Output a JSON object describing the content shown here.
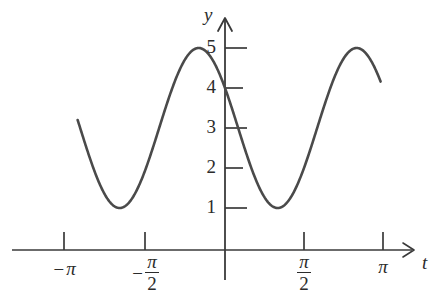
{
  "chart_data": {
    "type": "line",
    "title": "",
    "subtitle": "",
    "xlabel": "t",
    "ylabel": "y",
    "grid": false,
    "legend": "none",
    "xlim": [
      -3.6,
      3.55
    ],
    "ylim": [
      -0.75,
      5.9
    ],
    "xticks": [
      -3.14159,
      -1.5708,
      1.5708,
      3.14159
    ],
    "xticklabels": [
      "-π",
      "-π/2",
      "π/2",
      "π"
    ],
    "yticks": [
      1,
      2,
      3,
      4,
      5
    ],
    "yticklabels": [
      "1",
      "2",
      "3",
      "4",
      "5"
    ],
    "series": [
      {
        "name": "y(t)",
        "equation": "y = 3 + 2 sin(2t + 5π/6)",
        "amplitude": 2,
        "midline": 3,
        "period": 3.14159,
        "color": "#4a4a4a",
        "x": [
          -2.93,
          -2.8,
          -2.6,
          -2.4,
          -2.2,
          -2.0,
          -1.8,
          -1.6,
          -1.4,
          -1.2,
          -1.0,
          -0.8,
          -0.6,
          -0.4,
          -0.2,
          0.0,
          0.2,
          0.4,
          0.6,
          0.8,
          1.0,
          1.2,
          1.4,
          1.6,
          1.8,
          2.0,
          2.2,
          2.4,
          2.6,
          2.8,
          3.0,
          3.1
        ],
        "y": [
          3.0,
          3.5,
          4.27,
          4.82,
          4.99,
          4.73,
          4.1,
          3.26,
          2.37,
          1.6,
          1.12,
          1.01,
          1.29,
          1.9,
          2.72,
          3.0,
          3.99,
          4.62,
          4.97,
          4.91,
          4.43,
          3.66,
          2.75,
          1.9,
          1.3,
          1.02,
          1.16,
          1.67,
          2.47,
          3.37,
          4.23,
          4.5
        ]
      }
    ],
    "features": {
      "maxima_y": 5,
      "minima_y": 1,
      "y_intercept": 3
    }
  },
  "axes": {
    "y_axis_name": "y",
    "x_axis_name": "t",
    "origin_label": ""
  },
  "y_tick_labels": [
    "5",
    "4",
    "3",
    "2",
    "1"
  ],
  "x_tick_labels": [
    {
      "id": "neg-pi",
      "kind": "plain",
      "sign": "−",
      "text": "π"
    },
    {
      "id": "neg-pi-over-2",
      "kind": "fraction",
      "sign": "−",
      "num": "π",
      "den": "2"
    },
    {
      "id": "pi-over-2",
      "kind": "fraction",
      "sign": "",
      "num": "π",
      "den": "2"
    },
    {
      "id": "pi",
      "kind": "plain",
      "sign": "",
      "text": "π"
    }
  ],
  "colors": {
    "curve": "#4a4a4a",
    "axis": "#3a3a3a",
    "text": "#2b2b2b",
    "background": "#ffffff"
  }
}
